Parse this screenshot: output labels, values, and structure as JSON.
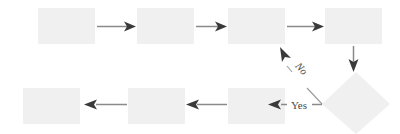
{
  "diagram": {
    "type": "flowchart",
    "title": "",
    "background_color": "#ffffff",
    "node_fill_color": "#f0f0f0",
    "line_color": "#8a8a8a",
    "arrowhead_color": "#3a3a3a",
    "label_color": "#4a4a4a",
    "nodes": [
      {
        "id": "n1",
        "shape": "rectangle",
        "label": "",
        "row": "top",
        "order": 1
      },
      {
        "id": "n2",
        "shape": "rectangle",
        "label": "",
        "row": "top",
        "order": 2
      },
      {
        "id": "n3",
        "shape": "rectangle",
        "label": "",
        "row": "top",
        "order": 3
      },
      {
        "id": "n4",
        "shape": "rectangle",
        "label": "",
        "row": "top",
        "order": 4
      },
      {
        "id": "n5",
        "shape": "diamond",
        "label": "",
        "row": "right",
        "order": 5
      },
      {
        "id": "n6",
        "shape": "rectangle",
        "label": "",
        "row": "bottom",
        "order": 6
      },
      {
        "id": "n7",
        "shape": "rectangle",
        "label": "",
        "row": "bottom",
        "order": 7
      },
      {
        "id": "n8",
        "shape": "rectangle",
        "label": "",
        "row": "bottom",
        "order": 8
      }
    ],
    "edges": [
      {
        "id": "e1",
        "from": "n1",
        "to": "n2",
        "label": "",
        "direction": "right"
      },
      {
        "id": "e2",
        "from": "n2",
        "to": "n3",
        "label": "",
        "direction": "right"
      },
      {
        "id": "e3",
        "from": "n3",
        "to": "n4",
        "label": "",
        "direction": "right"
      },
      {
        "id": "e4",
        "from": "n4",
        "to": "n5",
        "label": "",
        "direction": "down"
      },
      {
        "id": "e5",
        "from": "n5",
        "to": "n3",
        "label": "No",
        "direction": "up-left"
      },
      {
        "id": "e6",
        "from": "n5",
        "to": "n6",
        "label": "Yes",
        "direction": "left"
      },
      {
        "id": "e7",
        "from": "n6",
        "to": "n7",
        "label": "",
        "direction": "left"
      },
      {
        "id": "e8",
        "from": "n7",
        "to": "n8",
        "label": "",
        "direction": "left"
      }
    ],
    "labels": {
      "no": "No",
      "yes": "Yes"
    }
  }
}
